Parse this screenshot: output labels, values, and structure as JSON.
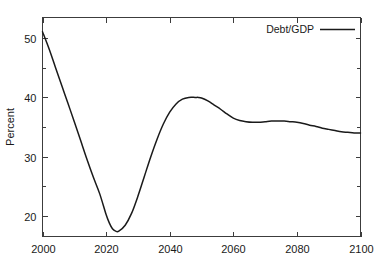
{
  "chart_data": {
    "type": "line",
    "title": "",
    "subtitle": "",
    "xlabel": "",
    "ylabel": "Percent",
    "xlim": [
      2000,
      2100
    ],
    "ylim": [
      16.5,
      53.5
    ],
    "grid": false,
    "legend_position": "top-right",
    "legend": [
      "Debt/GDP"
    ],
    "x_ticks": [
      2000,
      2020,
      2040,
      2060,
      2080,
      2100
    ],
    "x_tick_labels": [
      "2000",
      "2020",
      "2040",
      "2060",
      "2080",
      "2100"
    ],
    "y_ticks": [
      20,
      30,
      40,
      50
    ],
    "y_tick_labels": [
      "20",
      "30",
      "40",
      "50"
    ],
    "y_minor_ticks": [
      25,
      35,
      45
    ],
    "series": [
      {
        "name": "Debt/GDP",
        "color": "#1a1a1a",
        "x": [
          2000,
          2002,
          2004,
          2006,
          2008,
          2010,
          2012,
          2014,
          2016,
          2018,
          2020,
          2021,
          2022,
          2023,
          2024,
          2026,
          2028,
          2030,
          2032,
          2034,
          2036,
          2038,
          2040,
          2042,
          2044,
          2046,
          2048,
          2049,
          2050,
          2052,
          2054,
          2056,
          2058,
          2060,
          2062,
          2064,
          2066,
          2068,
          2070,
          2072,
          2074,
          2076,
          2078,
          2080,
          2082,
          2084,
          2086,
          2088,
          2090,
          2092,
          2094,
          2096,
          2098,
          2100
        ],
        "y": [
          51.1,
          48.3,
          45.2,
          42.1,
          39.0,
          35.9,
          32.7,
          29.5,
          26.5,
          23.7,
          20.2,
          18.8,
          17.8,
          17.4,
          17.4,
          18.4,
          20.4,
          23.3,
          26.6,
          29.9,
          32.9,
          35.5,
          37.5,
          38.9,
          39.7,
          40.0,
          40.0,
          40.0,
          39.9,
          39.4,
          38.7,
          38.0,
          37.2,
          36.5,
          36.1,
          35.9,
          35.8,
          35.8,
          35.9,
          36.0,
          36.0,
          36.0,
          35.9,
          35.8,
          35.6,
          35.3,
          35.1,
          34.8,
          34.6,
          34.4,
          34.2,
          34.1,
          34.0,
          34.0
        ]
      }
    ],
    "annotations": []
  },
  "legend": {
    "entries": [
      {
        "label": "Debt/GDP",
        "color": "#1a1a1a"
      }
    ]
  },
  "axes": {
    "y_title": "Percent",
    "x_title": ""
  },
  "colors": {
    "line": "#1a1a1a",
    "frame": "#3c3c3c",
    "background": "#ffffff",
    "text": "#1a1a1a"
  }
}
